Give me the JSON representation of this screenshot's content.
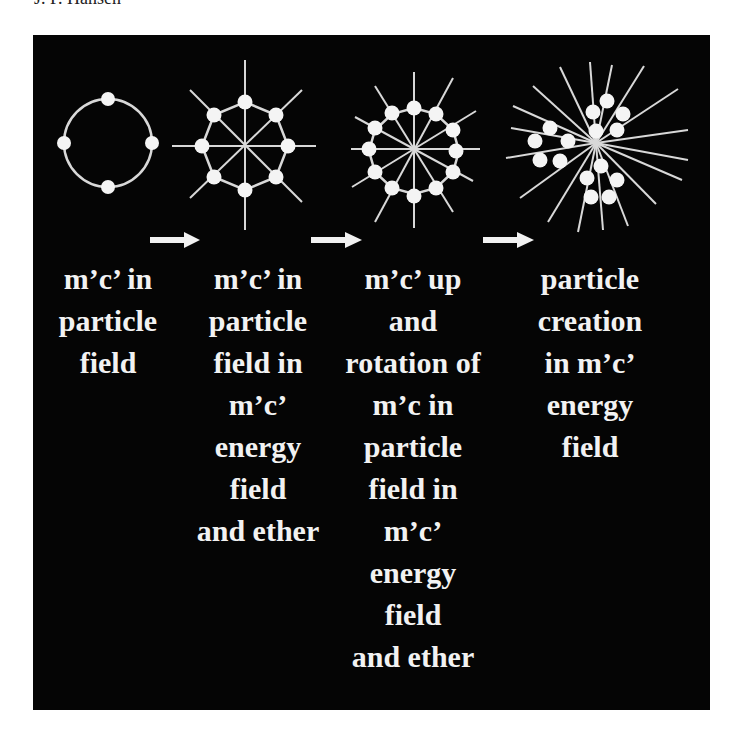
{
  "header": {
    "author": "J. P. Hansen"
  },
  "colors": {
    "background": "#050505",
    "foreground": "#f2f2f2",
    "page": "#ffffff"
  },
  "diagram": {
    "stages": [
      {
        "id": "stage-1",
        "particles": 4,
        "rays": 0,
        "lines": [
          "m’c’ in",
          "particle",
          "field"
        ]
      },
      {
        "id": "stage-2",
        "particles": 8,
        "rays": 8,
        "lines": [
          "m’c’ in",
          "particle",
          "field  in",
          "m’c’",
          "energy",
          "field",
          "and ether"
        ]
      },
      {
        "id": "stage-3",
        "particles": 12,
        "rays": 12,
        "lines": [
          "m’c’ up",
          "and",
          "rotation of",
          "m’c in",
          "particle",
          "field  in",
          "m’c’",
          "energy",
          "field",
          "and ether"
        ]
      },
      {
        "id": "stage-4",
        "particles": 16,
        "rays": 20,
        "lines": [
          "particle",
          "creation",
          "in m’c’",
          "energy",
          "field"
        ]
      }
    ],
    "arrows": [
      {
        "from": "stage-1",
        "to": "stage-2",
        "icon": "right-arrow-icon"
      },
      {
        "from": "stage-2",
        "to": "stage-3",
        "icon": "right-arrow-icon"
      },
      {
        "from": "stage-3",
        "to": "stage-4",
        "icon": "right-arrow-icon"
      }
    ]
  }
}
